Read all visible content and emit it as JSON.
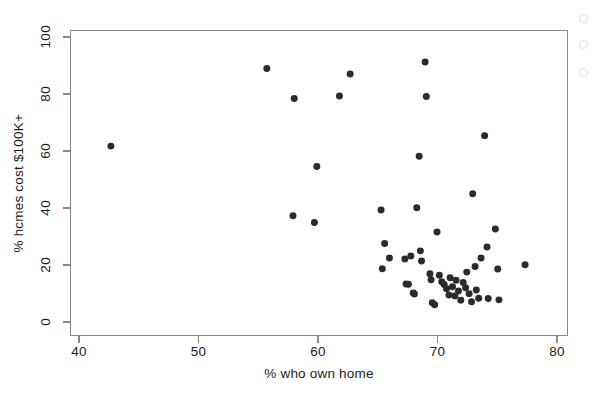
{
  "chart_data": {
    "type": "scatter",
    "title": "",
    "xlabel": "% who own home",
    "ylabel": "% hcmes cost $100K+",
    "xlim": [
      40,
      80
    ],
    "ylim": [
      0,
      100
    ],
    "xticks": [
      40,
      50,
      60,
      70,
      80
    ],
    "yticks": [
      0,
      20,
      40,
      60,
      80,
      100
    ],
    "grid": false,
    "legend": null,
    "marker": {
      "shape": "circle",
      "color": "#2b2b2b",
      "size": 7
    },
    "series": [
      {
        "name": "states",
        "points": [
          [
            42.6,
            61.8
          ],
          [
            55.7,
            89.2
          ],
          [
            58.0,
            78.6
          ],
          [
            57.9,
            37.2
          ],
          [
            59.7,
            34.8
          ],
          [
            59.9,
            54.6
          ],
          [
            61.8,
            79.5
          ],
          [
            62.7,
            87.3
          ],
          [
            65.3,
            39.2
          ],
          [
            65.4,
            18.5
          ],
          [
            65.6,
            27.4
          ],
          [
            66.0,
            22.3
          ],
          [
            67.3,
            21.9
          ],
          [
            67.4,
            13.1
          ],
          [
            67.6,
            13.0
          ],
          [
            67.8,
            23.0
          ],
          [
            68.0,
            9.9
          ],
          [
            68.1,
            9.6
          ],
          [
            68.3,
            40.0
          ],
          [
            68.5,
            58.2
          ],
          [
            68.6,
            24.8
          ],
          [
            68.7,
            21.2
          ],
          [
            69.0,
            91.5
          ],
          [
            69.1,
            79.3
          ],
          [
            69.4,
            16.7
          ],
          [
            69.5,
            14.6
          ],
          [
            69.6,
            6.5
          ],
          [
            69.8,
            5.8
          ],
          [
            70.0,
            31.5
          ],
          [
            70.2,
            16.2
          ],
          [
            70.4,
            13.9
          ],
          [
            70.6,
            12.9
          ],
          [
            70.8,
            11.4
          ],
          [
            71.0,
            9.2
          ],
          [
            71.1,
            15.3
          ],
          [
            71.3,
            12.1
          ],
          [
            71.5,
            8.9
          ],
          [
            71.6,
            14.4
          ],
          [
            71.8,
            10.6
          ],
          [
            72.0,
            7.4
          ],
          [
            72.2,
            13.6
          ],
          [
            72.4,
            11.8
          ],
          [
            72.5,
            17.3
          ],
          [
            72.7,
            9.7
          ],
          [
            72.9,
            6.8
          ],
          [
            73.0,
            45.0
          ],
          [
            73.2,
            19.3
          ],
          [
            73.3,
            11.0
          ],
          [
            73.5,
            8.1
          ],
          [
            73.7,
            22.3
          ],
          [
            74.0,
            65.5
          ],
          [
            74.2,
            26.2
          ],
          [
            74.3,
            8.0
          ],
          [
            74.9,
            32.5
          ],
          [
            75.1,
            18.4
          ],
          [
            75.2,
            7.5
          ],
          [
            77.4,
            19.9
          ]
        ]
      }
    ]
  },
  "axes": {
    "x_tick_labels": [
      "40",
      "50",
      "60",
      "70",
      "80"
    ],
    "y_tick_labels": [
      "0",
      "20",
      "40",
      "60",
      "80",
      "100"
    ]
  }
}
